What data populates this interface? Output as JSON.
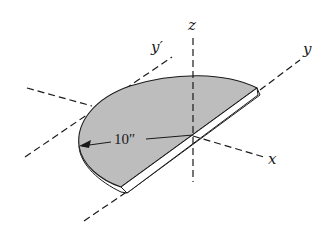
{
  "diagram": {
    "type": "engineering-figure",
    "colors": {
      "plate_fill": "#bdbdbd",
      "plate_edge": "#ffffff",
      "line": "#1a1a1a",
      "background": "#ffffff"
    },
    "axes": {
      "z": {
        "label": "z"
      },
      "y": {
        "label": "y"
      },
      "y_prime": {
        "label": "y′"
      },
      "x": {
        "label": "x"
      }
    },
    "dimension": {
      "radius_label": "10″"
    }
  }
}
